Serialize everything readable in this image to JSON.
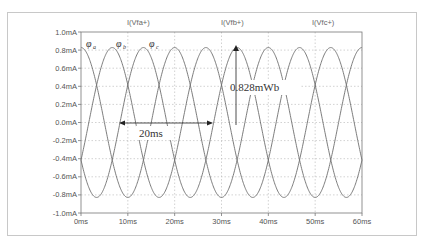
{
  "chart_data": {
    "type": "line",
    "title": "",
    "xlabel": "",
    "ylabel": "",
    "xlim": [
      0,
      60
    ],
    "ylim": [
      -1.0,
      1.0
    ],
    "x_unit": "ms",
    "y_unit": "mA",
    "grid": true,
    "x_ticks": [
      "0ms",
      "10ms",
      "20ms",
      "30ms",
      "40ms",
      "50ms",
      "60ms"
    ],
    "y_ticks": [
      "1.0mA",
      "0.8mA",
      "0.6mA",
      "0.4mA",
      "0.2mA",
      "0.0mA",
      "-0.2mA",
      "-0.4mA",
      "-0.6mA",
      "-0.8mA",
      "-1.0mA"
    ],
    "series": [
      {
        "name": "I(Vfa+)",
        "phase_label": "a",
        "amplitude": 0.828,
        "period_ms": 20,
        "peak_at_ms": 0
      },
      {
        "name": "I(Vfb+)",
        "phase_label": "b",
        "amplitude": 0.828,
        "period_ms": 20,
        "peak_at_ms": 6.67
      },
      {
        "name": "I(Vfc+)",
        "phase_label": "c",
        "amplitude": 0.828,
        "period_ms": 20,
        "peak_at_ms": 13.33
      }
    ],
    "annotations": [
      {
        "text": "20ms",
        "type": "double-arrow",
        "from_ms": 7.5,
        "to_ms": 27.5,
        "y": 0.0
      },
      {
        "text": "0.828mWb",
        "type": "arrow",
        "at_ms": 33.3,
        "y": 0.828
      }
    ]
  },
  "labels": {
    "trace_a": "I(Vfa+)",
    "trace_b": "I(Vfb+)",
    "trace_c": "I(Vfc+)",
    "phi_a": "a",
    "phi_b": "b",
    "phi_c": "c",
    "phi_symbol": "φ",
    "period_annotation": "20ms",
    "peak_annotation": "0.828mWb"
  },
  "colors": {
    "trace": "#6e6e6e",
    "grid": "#b4b4b4",
    "axis": "#777777",
    "frame": "#c8c8c8"
  }
}
